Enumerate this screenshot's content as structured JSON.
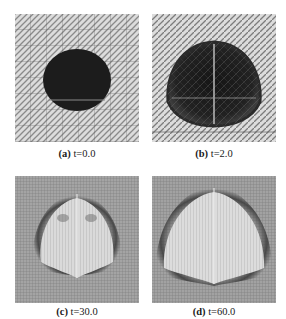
{
  "figure": {
    "panels": [
      {
        "id": "a",
        "label": "(a)",
        "caption": "t=0.0",
        "time": 0.0
      },
      {
        "id": "b",
        "label": "(b)",
        "caption": "t=2.0",
        "time": 2.0
      },
      {
        "id": "c",
        "label": "(c)",
        "caption": "t=30.0",
        "time": 30.0
      },
      {
        "id": "d",
        "label": "(d)",
        "caption": "t=60.0",
        "time": 60.0
      }
    ],
    "colors": {
      "background": "#ffffff",
      "mesh_light": "#d9d9d9",
      "mesh_dark": "#7a7a7a",
      "drop": "#1c1c1c",
      "late_field": "#9a9a9a",
      "late_interior": "#d6d6d6",
      "late_rim": "#3a3a3a"
    }
  }
}
